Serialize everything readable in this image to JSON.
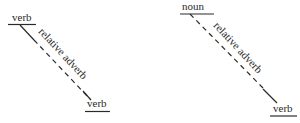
{
  "diagrams": [
    {
      "name": "verb-to-verb",
      "top_word": "verb",
      "connector": "relative adverb",
      "bottom_word": "verb"
    },
    {
      "name": "noun-to-verb",
      "top_word": "noun",
      "connector": "relative adverb",
      "bottom_word": "verb"
    }
  ],
  "colors": {
    "line": "#2a2a2a",
    "background": "#ffffff"
  }
}
